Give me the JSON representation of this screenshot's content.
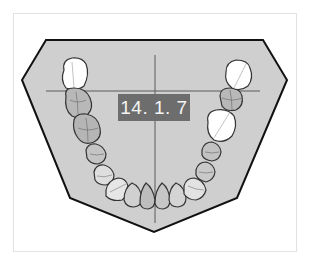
{
  "diagram": {
    "type": "dental-arch-lower",
    "label": "14. 1. 7",
    "colors": {
      "frame_border": "#e2e2e2",
      "arch_fill": "#cfcfcf",
      "arch_outline": "#111111",
      "crosshair": "#555555",
      "label_bg": "#6d6d6d",
      "label_text": "#f4f4f4",
      "tooth_white": "#ffffff",
      "tooth_gray": "#b5b5b5",
      "tooth_outline": "#444444"
    },
    "teeth": {
      "left_side": [
        "molar-missing-white",
        "molar",
        "molar",
        "premolar",
        "premolar",
        "canine"
      ],
      "front": [
        "incisor",
        "incisor",
        "incisor",
        "incisor"
      ],
      "right_side": [
        "molar-missing-white",
        "molar",
        "molar-missing-white",
        "premolar",
        "premolar",
        "canine"
      ]
    }
  }
}
